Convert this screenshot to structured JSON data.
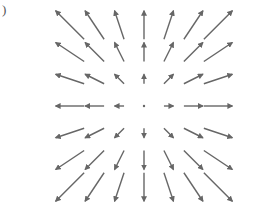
{
  "figure": {
    "label": ")",
    "type": "vector-field",
    "arrow_color": "#666666",
    "grid": {
      "cols": [
        -3,
        -2,
        -1,
        0,
        1,
        2,
        3
      ],
      "rows": [
        3,
        2,
        1,
        0,
        -1,
        -2,
        -3
      ]
    },
    "origin_px": [
      144,
      106
    ],
    "spacing_px": [
      24.7,
      27
    ],
    "scale_px_per_unit": 9.5
  }
}
